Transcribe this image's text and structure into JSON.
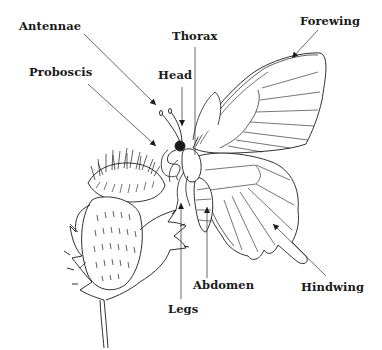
{
  "diagram": {
    "labels": {
      "antennae": "Antennae",
      "proboscis": "Proboscis",
      "head": "Head",
      "thorax": "Thorax",
      "forewing": "Forewing",
      "abdomen": "Abdomen",
      "legs": "Legs",
      "hindwing": "Hindwing"
    },
    "colors": {
      "ink": "#1a1a1a",
      "leader": "#444444",
      "background": "#ffffff"
    }
  }
}
